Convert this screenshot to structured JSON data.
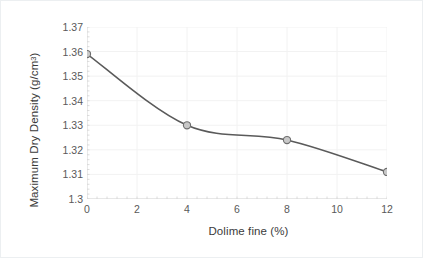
{
  "chart_data": {
    "type": "line",
    "title": "",
    "xlabel": "Dolime fine (%)",
    "ylabel": "Maximum Dry Density (g/cm",
    "ylabel_sup": "3",
    "ylabel_suffix": ")",
    "x": [
      0,
      4,
      8,
      12
    ],
    "values": [
      1.359,
      1.33,
      1.324,
      1.311
    ],
    "series": [
      {
        "name": "Maximum Dry Density",
        "values": [
          1.359,
          1.33,
          1.324,
          1.311
        ]
      }
    ],
    "xlim": [
      0,
      12
    ],
    "ylim": [
      1.3,
      1.37
    ],
    "xticks": [
      0,
      2,
      4,
      6,
      8,
      10,
      12
    ],
    "xtick_labels": [
      "0",
      "2",
      "4",
      "6",
      "8",
      "10",
      "12"
    ],
    "yticks": [
      1.3,
      1.31,
      1.32,
      1.33,
      1.34,
      1.35,
      1.36,
      1.37
    ],
    "ytick_labels": [
      "1.3",
      "1.31",
      "1.32",
      "1.33",
      "1.34",
      "1.35",
      "1.36",
      "1.37"
    ],
    "grid": true,
    "grid_color": "#f2f2f2",
    "legend": "none",
    "line_color": "#5a5a5a",
    "marker_fill": "#c8c8c8",
    "marker_edge": "#6e6e6e",
    "axis_color": "#d4d4d4",
    "text_color": "#3b3b3b",
    "tick_text_color": "#595959",
    "background": "#ffffff",
    "smoothing": "spline"
  }
}
